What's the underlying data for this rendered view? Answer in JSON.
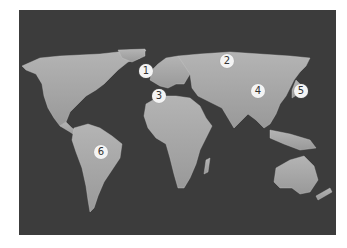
{
  "map": {
    "background_color": "#3c3c3c",
    "land_color": "#a6a6a6",
    "marker_fill": "#f4f4f4",
    "marker_text_color": "#333333",
    "markers": [
      {
        "label": "1",
        "region": "United Kingdom / Western Europe",
        "x": 146,
        "y": 71
      },
      {
        "label": "2",
        "region": "Russia",
        "x": 227,
        "y": 61
      },
      {
        "label": "3",
        "region": "Morocco / North Africa",
        "x": 159,
        "y": 96
      },
      {
        "label": "4",
        "region": "China",
        "x": 258,
        "y": 91
      },
      {
        "label": "5",
        "region": "Japan",
        "x": 301,
        "y": 91
      },
      {
        "label": "6",
        "region": "Brazil",
        "x": 101,
        "y": 152
      }
    ]
  }
}
